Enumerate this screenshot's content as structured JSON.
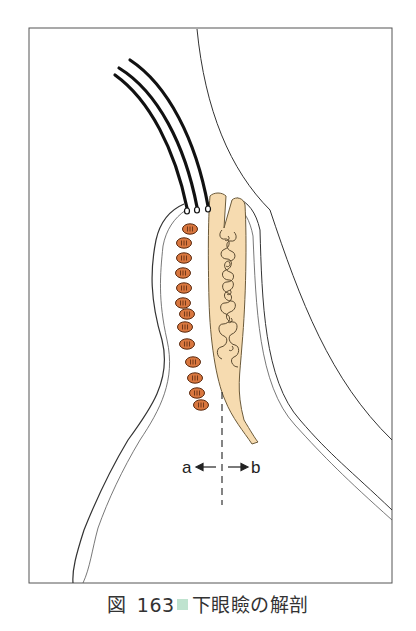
{
  "figure": {
    "frame": {
      "x": 29,
      "y": 28,
      "width": 363,
      "height": 555
    },
    "labels": {
      "left": "a",
      "right": "b"
    },
    "colors": {
      "tarsal_plate": "#f6dbb0",
      "muscle_fill": "#d9773f",
      "muscle_stroke": "#5a2a10",
      "line": "#333333",
      "lash": "#111111",
      "caption_square": "#bfe3cf"
    },
    "structures": [
      "eyelashes",
      "orbicularis-muscle",
      "tarsal-plate",
      "meibomian-gland",
      "skin-surface",
      "conjunctiva",
      "globe-surface",
      "section-line"
    ],
    "muscle_count": 13
  },
  "caption": {
    "prefix": "図",
    "number": "163",
    "title": "下眼瞼の解剖"
  }
}
